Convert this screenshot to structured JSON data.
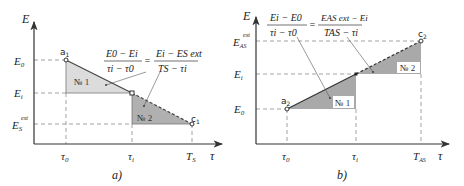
{
  "colors": {
    "axis": "#333333",
    "dash": "#888888",
    "fill_light": "#d9d9d9",
    "fill_dark": "#a9a9a9",
    "line": "#444444"
  },
  "panel_a": {
    "caption": "a)",
    "y_axis_label": "E",
    "x_axis_label": "τ",
    "y_ticks": [
      "E0",
      "Ei",
      "ES ext"
    ],
    "y_tick_main": [
      "E",
      "E",
      "E"
    ],
    "y_tick_sub": [
      "0",
      "i",
      "S"
    ],
    "y_tick_sup": [
      "",
      "",
      "ext"
    ],
    "x_tick_main": [
      "τ",
      "τ",
      "T"
    ],
    "x_tick_sub": [
      "0",
      "i",
      "S"
    ],
    "point_start": {
      "main": "a",
      "sub": "1"
    },
    "point_end": {
      "main": "c",
      "sub": "1"
    },
    "region1": "№ 1",
    "region2": "№ 2",
    "formula": {
      "lhs_num": "E0 − Ei",
      "lhs_den": "τi − τ0",
      "equals": "=",
      "rhs_num": "Ei − ES ext",
      "rhs_den": "TS − τi"
    }
  },
  "panel_b": {
    "caption": "b)",
    "y_axis_label": "E",
    "x_axis_label": "τ",
    "y_tick_main": [
      "E",
      "E",
      "E"
    ],
    "y_tick_sub": [
      "AS",
      "i",
      "0"
    ],
    "y_tick_sup": [
      "ext",
      "",
      ""
    ],
    "x_tick_main": [
      "τ",
      "τ",
      "T"
    ],
    "x_tick_sub": [
      "0",
      "i",
      "AS"
    ],
    "point_start": {
      "main": "a",
      "sub": "2"
    },
    "point_end": {
      "main": "c",
      "sub": "2"
    },
    "region1": "№ 1",
    "region2": "№ 2",
    "formula": {
      "lhs_num": "Ei − E0",
      "lhs_den": "τi − τ0",
      "equals": "=",
      "rhs_num": "EAS ext − Ei",
      "rhs_den": "TAS − τi"
    }
  }
}
